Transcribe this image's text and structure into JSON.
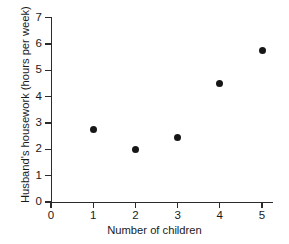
{
  "chart_data": {
    "type": "scatter",
    "title": "",
    "xlabel": "Number of children",
    "ylabel": "Husband's housework (hours per week)",
    "xlim": [
      0,
      5
    ],
    "ylim": [
      0,
      7
    ],
    "xticks": [
      "0",
      "1",
      "2",
      "3",
      "4",
      "5"
    ],
    "yticks": [
      "0",
      "1",
      "2",
      "3",
      "4",
      "5",
      "6",
      "7"
    ],
    "grid": false,
    "legend": false,
    "marker": {
      "shape": "filled-circle",
      "color": "#161616",
      "size_px": 7
    },
    "x": [
      1,
      2,
      3,
      4,
      5
    ],
    "y": [
      2.75,
      2.0,
      2.45,
      4.5,
      5.75
    ],
    "points": [
      {
        "x": 1,
        "y": 2.75
      },
      {
        "x": 2,
        "y": 2.0
      },
      {
        "x": 3,
        "y": 2.45
      },
      {
        "x": 4,
        "y": 4.5
      },
      {
        "x": 5,
        "y": 5.75
      }
    ]
  },
  "axes": {
    "color": "#2b2b2b"
  }
}
